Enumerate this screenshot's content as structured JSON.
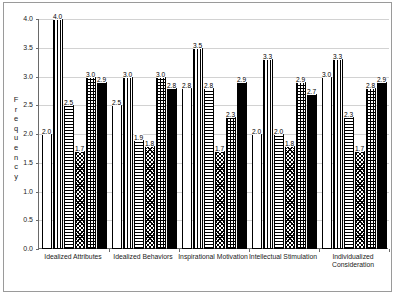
{
  "chart_data": {
    "type": "bar",
    "title": "",
    "xlabel": "",
    "ylabel": "Frequency",
    "ylim": [
      0,
      4.0
    ],
    "yticks": [
      "0.0",
      "0.5",
      "1.0",
      "1.5",
      "2.0",
      "2.5",
      "3.0",
      "3.5",
      "4.0"
    ],
    "grid": true,
    "legend": "none",
    "categories": [
      "Idealized Attributes",
      "Idealized Behaviors",
      "Inspirational Motivation",
      "Intellectual Stimulation",
      "Individualized Consideration"
    ],
    "series": [
      {
        "name": "series-1-white",
        "pattern": "solid-white",
        "values": [
          2.0,
          2.5,
          2.8,
          2.0,
          3.0
        ]
      },
      {
        "name": "series-2-vertical-stripes",
        "pattern": "vertical-stripes",
        "values": [
          4.0,
          3.0,
          3.5,
          3.3,
          3.3
        ]
      },
      {
        "name": "series-3-horizontal-stripes",
        "pattern": "horizontal-stripes",
        "values": [
          2.5,
          1.9,
          2.8,
          2.0,
          2.3
        ]
      },
      {
        "name": "series-4-diagonal-crosshatch",
        "pattern": "diagonal-crosshatch",
        "values": [
          1.7,
          1.8,
          1.7,
          1.8,
          1.7
        ]
      },
      {
        "name": "series-5-grid",
        "pattern": "grid",
        "values": [
          3.0,
          3.0,
          2.3,
          2.9,
          2.8
        ]
      },
      {
        "name": "series-6-black",
        "pattern": "solid-black",
        "values": [
          2.9,
          2.8,
          2.9,
          2.7,
          2.9
        ]
      }
    ],
    "colors": {
      "axis": "#6a6a6a",
      "gridline": "#d2d2d2",
      "bar_outline": "#000000",
      "frame": "#9a9a9a",
      "text": "#222222"
    }
  }
}
